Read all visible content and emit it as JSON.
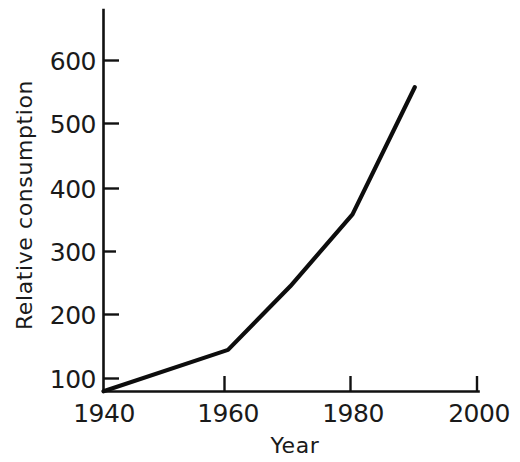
{
  "chart_data": {
    "type": "line",
    "title": "",
    "xlabel": "Year",
    "ylabel": "Relative consumption",
    "xlim": [
      1940,
      2000
    ],
    "ylim": [
      80,
      640
    ],
    "grid": false,
    "legend": "none",
    "x_ticks": [
      "1940",
      "1960",
      "1980",
      "2000"
    ],
    "x_tick_values": [
      1940,
      1960,
      1980,
      2000
    ],
    "y_ticks": [
      "100",
      "200",
      "300",
      "400",
      "500",
      "600"
    ],
    "y_tick_values": [
      100,
      200,
      300,
      400,
      500,
      600
    ],
    "series": [
      {
        "name": "Relative consumption",
        "x": [
          1940,
          1960,
          1970,
          1980,
          1990
        ],
        "values": [
          80,
          145,
          245,
          358,
          558
        ],
        "color": "#0d0d0d"
      }
    ]
  },
  "axes": {
    "y_title": "Relative consumption",
    "x_title": "Year",
    "y_tick_labels": [
      "600",
      "500",
      "400",
      "300",
      "200",
      "100"
    ],
    "x_tick_labels": [
      "1940",
      "1960",
      "1980",
      "2000"
    ]
  },
  "colors": {
    "ink": "#0d0d0d",
    "background": "#ffffff"
  }
}
